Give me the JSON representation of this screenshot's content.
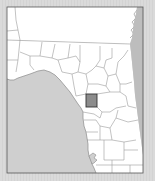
{
  "map": {
    "type": "locator-map",
    "region": "Florida (north-central)",
    "colors": {
      "background": "#d9d9d9",
      "land": "#ffffff",
      "water": "#cfcfcf",
      "county_border": "#9a9a9a",
      "frame": "#555555",
      "highlight_fill": "#8c8c8c",
      "highlight_border": "#333333"
    },
    "highlighted_county": {
      "x": 86,
      "y": 94,
      "width": 11,
      "height": 13
    }
  }
}
